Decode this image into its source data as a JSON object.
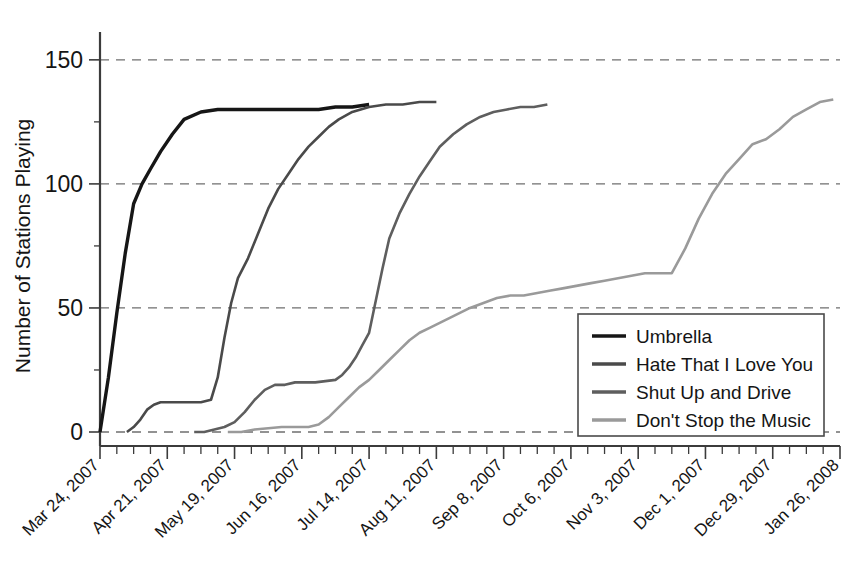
{
  "chart_data": {
    "type": "line",
    "title": "",
    "xlabel": "",
    "ylabel": "Number of Stations Playing",
    "ylim": [
      0,
      158
    ],
    "yticks": [
      0,
      50,
      100,
      150
    ],
    "ytick_labels": [
      "0",
      "50",
      "100",
      "150"
    ],
    "grid": true,
    "grid_axis": "y",
    "legend_position": "lower-right",
    "x_tick_labels": [
      "Mar 24, 2007",
      "Apr 21, 2007",
      "May 19, 2007",
      "Jun 16, 2007",
      "Jul 14, 2007",
      "Aug 11, 2007",
      "Sep 8, 2007",
      "Oct 6, 2007",
      "Nov 3, 2007",
      "Dec 1, 2007",
      "Dec 29, 2007",
      "Jan 26, 2008"
    ],
    "x_unit": "weeks since Mar 24, 2007",
    "x_major_interval_weeks": 4,
    "x_minor_interval_weeks": 1,
    "xlim_weeks": [
      0,
      44
    ],
    "series": [
      {
        "name": "Umbrella",
        "color": "#161616",
        "width": 3.4,
        "dash": "none",
        "x": [
          0,
          0.5,
          1,
          1.5,
          2,
          2.5,
          3,
          3.6,
          4.3,
          5,
          6,
          7,
          8,
          9,
          10,
          11,
          12,
          13,
          14,
          15,
          16
        ],
        "y": [
          0,
          22,
          48,
          72,
          92,
          100,
          106,
          113,
          120,
          126,
          129,
          130,
          130,
          130,
          130,
          130,
          130,
          130,
          131,
          131,
          132
        ]
      },
      {
        "name": "Hate That I Love You",
        "color": "#4a4a4a",
        "width": 2.6,
        "dash": "none",
        "x": [
          1.6,
          2,
          2.4,
          2.8,
          3.2,
          3.6,
          4,
          5,
          6,
          6.6,
          7,
          7.4,
          7.8,
          8.2,
          8.8,
          9.4,
          10,
          10.6,
          11.2,
          11.8,
          12.4,
          13,
          13.6,
          14.2,
          15,
          16,
          17,
          18,
          19,
          20
        ],
        "y": [
          0,
          2,
          5,
          9,
          11,
          12,
          12,
          12,
          12,
          13,
          22,
          38,
          52,
          62,
          70,
          80,
          90,
          98,
          104,
          110,
          115,
          119,
          123,
          126,
          129,
          131,
          132,
          132,
          133,
          133
        ]
      },
      {
        "name": "Shut Up and Drive",
        "color": "#5e5e5e",
        "width": 2.6,
        "dash": "none",
        "x": [
          5.6,
          6.2,
          6.8,
          7.4,
          8,
          8.6,
          9.2,
          9.8,
          10.4,
          11,
          11.6,
          12.2,
          12.8,
          13.4,
          14,
          14.4,
          14.8,
          15.2,
          15.6,
          16,
          16.4,
          16.8,
          17.2,
          17.8,
          18.4,
          19,
          19.6,
          20.2,
          21,
          21.8,
          22.6,
          23.4,
          24.2,
          25,
          25.8,
          26.6
        ],
        "y": [
          0,
          0,
          1,
          2,
          4,
          8,
          13,
          17,
          19,
          19,
          20,
          20,
          20,
          20.5,
          21,
          23,
          26,
          30,
          35,
          40,
          53,
          66,
          78,
          88,
          96,
          103,
          109,
          115,
          120,
          124,
          127,
          129,
          130,
          131,
          131,
          132
        ]
      },
      {
        "name": "Don't Stop the Music",
        "color": "#9a9a9a",
        "width": 2.6,
        "dash": "none",
        "x": [
          7.6,
          8.4,
          9.2,
          10,
          10.8,
          11.6,
          12.4,
          13,
          13.6,
          14.2,
          14.8,
          15.4,
          16,
          16.6,
          17.2,
          17.8,
          18.4,
          19,
          19.6,
          20.2,
          20.8,
          21.4,
          22,
          22.8,
          23.6,
          24.4,
          25.2,
          26,
          26.8,
          27.6,
          28.4,
          29.2,
          30,
          30.8,
          31.6,
          32.4,
          33.2,
          34,
          34.8,
          35.6,
          36.4,
          37.2,
          38,
          38.8,
          39.6,
          40.4,
          41.2,
          42,
          42.8,
          43.6
        ],
        "y": [
          0,
          0,
          1,
          1.5,
          2,
          2,
          2,
          3,
          6,
          10,
          14,
          18,
          21,
          25,
          29,
          33,
          37,
          40,
          42,
          44,
          46,
          48,
          50,
          52,
          54,
          55,
          55,
          56,
          57,
          58,
          59,
          60,
          61,
          62,
          63,
          64,
          64,
          64,
          74,
          86,
          96,
          104,
          110,
          116,
          118,
          122,
          127,
          130,
          133,
          134
        ]
      }
    ]
  },
  "legend": {
    "items": [
      {
        "label": "Umbrella"
      },
      {
        "label": "Hate That I Love You"
      },
      {
        "label": "Shut Up and Drive"
      },
      {
        "label": "Don't Stop the Music"
      }
    ]
  }
}
